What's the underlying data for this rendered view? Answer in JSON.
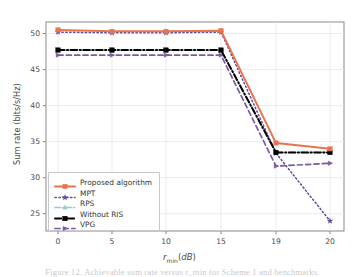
{
  "figure": {
    "caption": "Figure 12. Achievable sum rate versus r_min for Scheme 1 and benchmarks."
  },
  "chart_data": {
    "type": "line",
    "title": "",
    "xlabel": "r_min(dB)",
    "ylabel": "Sum rate (bits/s/Hz)",
    "x": [
      0,
      5,
      10,
      15,
      19,
      20
    ],
    "xticklabels": [
      "0",
      "5",
      "10",
      "15",
      "19",
      "20"
    ],
    "yticklabels": [
      "25",
      "30",
      "35",
      "40",
      "45",
      "50"
    ],
    "yticks": [
      25,
      30,
      35,
      40,
      45,
      50
    ],
    "ylim": [
      22.6,
      51.6
    ],
    "grid": true,
    "legend_position": "lower left",
    "series": [
      {
        "name": "Proposed algorithm",
        "color": "#E8734F",
        "linestyle": "solid",
        "marker": "square",
        "values": [
          50.5,
          50.3,
          50.3,
          50.4,
          34.8,
          34.0
        ]
      },
      {
        "name": "MPT",
        "color": "#5B4A9E",
        "linestyle": "dotted",
        "marker": "star",
        "values": [
          50.2,
          50.1,
          50.1,
          50.2,
          33.4,
          24.0
        ]
      },
      {
        "name": "RPS",
        "color": "#8FCFD1",
        "linestyle": "dashdot",
        "marker": "triangle",
        "values": [
          47.7,
          47.7,
          47.7,
          47.7,
          33.5,
          33.5
        ]
      },
      {
        "name": "Without RIS",
        "color": "#000000",
        "linestyle": "dashdot",
        "marker": "square",
        "values": [
          47.7,
          47.7,
          47.7,
          47.7,
          33.5,
          33.5
        ]
      },
      {
        "name": "VPG",
        "color": "#7B5A9E",
        "linestyle": "dashed",
        "marker": "triangle-right",
        "values": [
          47.0,
          47.0,
          47.0,
          47.0,
          31.6,
          32.0
        ]
      }
    ]
  },
  "axis": {
    "y_tick_labels": [
      "50",
      "45",
      "40",
      "35",
      "30",
      "25"
    ],
    "x_tick_labels": [
      "0",
      "5",
      "10",
      "15",
      "19",
      "20"
    ]
  },
  "legend": {
    "items": [
      {
        "label": "Proposed algorithm"
      },
      {
        "label": "MPT"
      },
      {
        "label": "RPS"
      },
      {
        "label": "Without RIS"
      },
      {
        "label": "VPG"
      }
    ]
  }
}
